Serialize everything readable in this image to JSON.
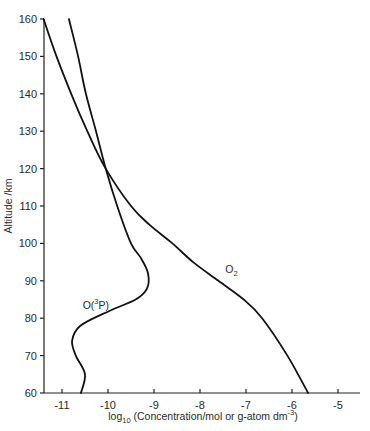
{
  "chart_data": {
    "type": "line",
    "title": "",
    "xlabel": "log10 (Concentration/mol or g-atom dm^-3)",
    "xlabel_parts": {
      "pre": "log",
      "sub": "10",
      "main": " (Concentration/mol or g-atom dm",
      "sup": "-3",
      "post": ")"
    },
    "ylabel": "Altitude /km",
    "xlim": [
      -11.4,
      -4.7
    ],
    "ylim": [
      60,
      160
    ],
    "xticks": [
      -11,
      -10,
      -9,
      -8,
      -7,
      -6,
      -5
    ],
    "yticks": [
      60,
      70,
      80,
      90,
      100,
      110,
      120,
      130,
      140,
      150,
      160
    ],
    "grid": false,
    "legend": "inline labels on curves",
    "series": [
      {
        "name": "O(3P)",
        "label_parts": {
          "pre": "O(",
          "sup": "3",
          "post": "P)"
        },
        "label_position": {
          "x": -10.55,
          "altitude": 82.5
        },
        "points": [
          [
            -10.59,
            60
          ],
          [
            -10.5,
            65
          ],
          [
            -10.7,
            70
          ],
          [
            -10.78,
            74
          ],
          [
            -10.6,
            78
          ],
          [
            -9.96,
            82
          ],
          [
            -9.4,
            85
          ],
          [
            -9.15,
            88
          ],
          [
            -9.13,
            92
          ],
          [
            -9.28,
            96
          ],
          [
            -9.5,
            100
          ],
          [
            -9.8,
            110
          ],
          [
            -10.05,
            120
          ],
          [
            -10.26,
            130
          ],
          [
            -10.48,
            140
          ],
          [
            -10.65,
            150
          ],
          [
            -10.85,
            160
          ]
        ]
      },
      {
        "name": "O2",
        "label_parts": {
          "pre": "O",
          "sub": "2"
        },
        "label_position": {
          "x": -7.45,
          "altitude": 92
        },
        "points": [
          [
            -5.65,
            60
          ],
          [
            -6.1,
            70
          ],
          [
            -6.65,
            80
          ],
          [
            -7.05,
            85
          ],
          [
            -7.6,
            90
          ],
          [
            -8.15,
            95
          ],
          [
            -8.6,
            100
          ],
          [
            -9.1,
            105
          ],
          [
            -9.5,
            110
          ],
          [
            -10.05,
            120
          ],
          [
            -10.45,
            130
          ],
          [
            -10.8,
            140
          ],
          [
            -11.12,
            150
          ],
          [
            -11.4,
            160
          ]
        ]
      }
    ]
  }
}
